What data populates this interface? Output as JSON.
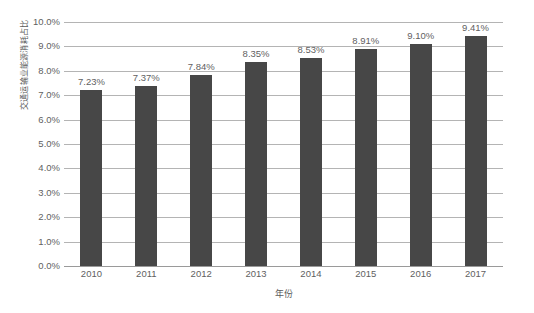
{
  "chart_data": {
    "type": "bar",
    "title": "",
    "subtitle": "",
    "xlabel": "年份",
    "ylabel": "交通运输业能源消耗占比",
    "categories": [
      "2010",
      "2011",
      "2012",
      "2013",
      "2014",
      "2015",
      "2016",
      "2017"
    ],
    "values": [
      7.23,
      7.37,
      7.84,
      8.35,
      8.53,
      8.91,
      9.1,
      9.41
    ],
    "data_labels": [
      "7.23%",
      "7.37%",
      "7.84%",
      "8.35%",
      "8.53%",
      "8.91%",
      "9.10%",
      "9.41%"
    ],
    "ylim": [
      0,
      10
    ],
    "ytick_values": [
      10.0,
      9.0,
      8.0,
      7.0,
      6.0,
      5.0,
      4.0,
      3.0,
      2.0,
      1.0,
      0.0
    ],
    "ytick_labels": [
      "10.0%",
      "9.0%",
      "8.0%",
      "7.0%",
      "6.0%",
      "5.0%",
      "4.0%",
      "3.0%",
      "2.0%",
      "1.0%",
      "0.0%"
    ],
    "grid": true,
    "grid_axis": "y",
    "legend": false,
    "legend_position": "none",
    "series": [
      {
        "name": "交通运输业能源消耗占比",
        "values": [
          7.23,
          7.37,
          7.84,
          8.35,
          8.53,
          8.91,
          9.1,
          9.41
        ]
      }
    ],
    "colors": {
      "bar": "#474747",
      "gridline": "#b4b4b4",
      "axis": "#9a9a9a",
      "text": "#5f5f5f",
      "background": "#ffffff"
    }
  }
}
